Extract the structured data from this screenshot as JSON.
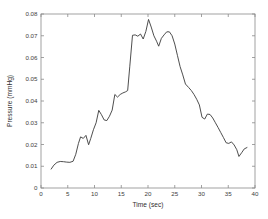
{
  "chart_data": {
    "type": "line",
    "title": "",
    "xlabel": "Time (sec)",
    "ylabel": "Pressure (mmHg)",
    "xlim": [
      0,
      40
    ],
    "ylim": [
      0,
      0.08
    ],
    "xticks": [
      0,
      5,
      10,
      15,
      20,
      25,
      30,
      35,
      40
    ],
    "xticklabels": [
      "0",
      "5",
      "10",
      "15",
      "20",
      "25",
      "30",
      "35",
      "40"
    ],
    "yticks": [
      0,
      0.01,
      0.02,
      0.03,
      0.04,
      0.05,
      0.06,
      0.07,
      0.08
    ],
    "yticklabels": [
      "0",
      "0.01",
      "0.02",
      "0.03",
      "0.04",
      "0.05",
      "0.06",
      "0.07",
      "0.08"
    ],
    "grid": false,
    "legend": null,
    "line_color": "#3a3a3a",
    "axes_color": "#8a8a8a",
    "background_color": "#ffffff",
    "series": [
      {
        "name": "pressure",
        "x": [
          1.9,
          2.4,
          3.0,
          3.6,
          4.2,
          4.8,
          5.4,
          6.0,
          6.5,
          7.0,
          7.4,
          7.9,
          8.4,
          8.9,
          9.3,
          9.8,
          10.3,
          10.8,
          11.3,
          11.8,
          12.3,
          12.8,
          13.3,
          13.8,
          14.3,
          14.8,
          15.3,
          15.8,
          16.2,
          16.6,
          17.1,
          17.6,
          18.1,
          18.6,
          19.1,
          19.6,
          20.1,
          20.6,
          21.1,
          21.6,
          22.0,
          22.5,
          23.0,
          23.5,
          24.0,
          24.5,
          25.0,
          25.5,
          26.0,
          26.5,
          27.0,
          27.6,
          28.1,
          28.6,
          29.1,
          29.6,
          30.1,
          30.6,
          31.1,
          31.6,
          32.1,
          32.6,
          33.1,
          33.6,
          34.1,
          34.6,
          35.1,
          35.6,
          36.1,
          36.6,
          37.0,
          37.5,
          38.0,
          38.5
        ],
        "y": [
          0.0087,
          0.0105,
          0.0118,
          0.0122,
          0.0121,
          0.0119,
          0.0118,
          0.0123,
          0.0155,
          0.0205,
          0.0235,
          0.0228,
          0.0242,
          0.0199,
          0.0228,
          0.0268,
          0.03,
          0.0357,
          0.0337,
          0.0313,
          0.031,
          0.033,
          0.0358,
          0.043,
          0.0418,
          0.043,
          0.0437,
          0.0442,
          0.0448,
          0.056,
          0.0702,
          0.0704,
          0.0698,
          0.0708,
          0.0685,
          0.072,
          0.0775,
          0.074,
          0.07,
          0.0675,
          0.0652,
          0.0688,
          0.0704,
          0.0718,
          0.0718,
          0.07,
          0.0662,
          0.061,
          0.0558,
          0.052,
          0.0478,
          0.0462,
          0.0448,
          0.043,
          0.0408,
          0.0382,
          0.0325,
          0.0317,
          0.034,
          0.0338,
          0.0322,
          0.03,
          0.0278,
          0.0255,
          0.0232,
          0.0208,
          0.0205,
          0.0212,
          0.0198,
          0.0176,
          0.0145,
          0.0162,
          0.018,
          0.0186
        ]
      }
    ]
  },
  "figure": {
    "plot_area": {
      "left": 41,
      "top": 14,
      "right": 255,
      "bottom": 188
    }
  }
}
